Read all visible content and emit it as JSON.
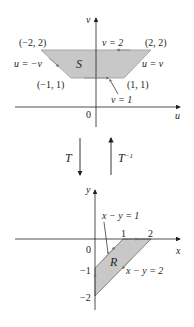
{
  "top_plot": {
    "axis_labels": {
      "vertical": "v",
      "horizontal": "u",
      "origin": "0"
    },
    "region_label": "S",
    "vertices": {
      "top_left": "(−2, 2)",
      "top_right": "(2, 2)",
      "bottom_left": "(−1, 1)",
      "bottom_right": "(1, 1)"
    },
    "boundaries": {
      "top": "v = 2",
      "left": "u = −v",
      "right": "u = v",
      "bottom": "v = 1"
    },
    "fill_color": "#c8c8c8"
  },
  "transform": {
    "forward": "T",
    "inverse_base": "T",
    "inverse_exp": "−1"
  },
  "bottom_plot": {
    "axis_labels": {
      "vertical": "y",
      "horizontal": "x",
      "origin": "0"
    },
    "region_label": "R",
    "ticks": {
      "x1": "1",
      "x2": "2",
      "ym1": "−1",
      "ym2": "−2"
    },
    "boundaries": {
      "upper": "x − y = 1",
      "lower": "x − y = 2"
    },
    "fill_color": "#c8c8c8"
  }
}
